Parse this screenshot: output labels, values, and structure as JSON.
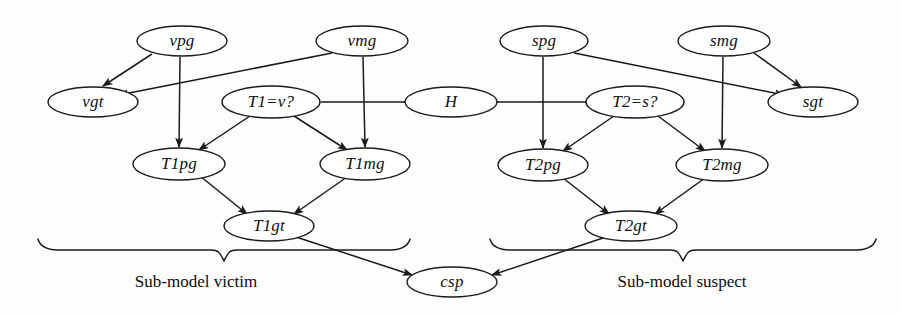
{
  "diagram": {
    "stroke_color": "#1a1a1a",
    "node_fill": "#ffffff",
    "background": "#fdfdfc",
    "nodes": [
      {
        "id": "vpg",
        "label": "vpg",
        "cx": 182,
        "cy": 41,
        "rx": 45,
        "ry": 15
      },
      {
        "id": "vmg",
        "label": "vmg",
        "cx": 362,
        "cy": 41,
        "rx": 46,
        "ry": 15
      },
      {
        "id": "vgt",
        "label": "vgt",
        "cx": 93,
        "cy": 102,
        "rx": 45,
        "ry": 15
      },
      {
        "id": "T1v",
        "label": "T1=v?",
        "cx": 271,
        "cy": 102,
        "rx": 49,
        "ry": 16
      },
      {
        "id": "H",
        "label": "H",
        "cx": 451,
        "cy": 102,
        "rx": 46,
        "ry": 15
      },
      {
        "id": "T2s",
        "label": "T2=s?",
        "cx": 635,
        "cy": 102,
        "rx": 49,
        "ry": 16
      },
      {
        "id": "spg",
        "label": "spg",
        "cx": 544,
        "cy": 41,
        "rx": 44,
        "ry": 15
      },
      {
        "id": "smg",
        "label": "smg",
        "cx": 724,
        "cy": 41,
        "rx": 46,
        "ry": 15
      },
      {
        "id": "sgt",
        "label": "sgt",
        "cx": 813,
        "cy": 102,
        "rx": 45,
        "ry": 15
      },
      {
        "id": "T1pg",
        "label": "T1pg",
        "cx": 179,
        "cy": 164,
        "rx": 46,
        "ry": 16
      },
      {
        "id": "T1mg",
        "label": "T1mg",
        "cx": 365,
        "cy": 164,
        "rx": 45,
        "ry": 16
      },
      {
        "id": "T1gt",
        "label": "T1gt",
        "cx": 269,
        "cy": 226,
        "rx": 45,
        "ry": 15
      },
      {
        "id": "T2pg",
        "label": "T2pg",
        "cx": 543,
        "cy": 165,
        "rx": 45,
        "ry": 16
      },
      {
        "id": "T2mg",
        "label": "T2mg",
        "cx": 722,
        "cy": 165,
        "rx": 46,
        "ry": 16
      },
      {
        "id": "T2gt",
        "label": "T2gt",
        "cx": 631,
        "cy": 226,
        "rx": 46,
        "ry": 15
      },
      {
        "id": "csp",
        "label": "csp",
        "cx": 452,
        "cy": 282,
        "rx": 45,
        "ry": 15
      }
    ],
    "edges": [
      {
        "id": "vpg-vgt",
        "from": "vpg",
        "to": "vgt",
        "path": "M 152 54 L 103 86"
      },
      {
        "id": "vmg-vgt",
        "from": "vmg",
        "to": "vgt",
        "path": "M 332 53 L 119 95"
      },
      {
        "id": "vpg-T1pg",
        "from": "vpg",
        "to": "T1pg",
        "path": "M 180 57 L 179 147"
      },
      {
        "id": "vmg-T1mg",
        "from": "vmg",
        "to": "T1mg",
        "path": "M 363 57 L 365 147"
      },
      {
        "id": "T1v-H",
        "from": "T1v",
        "to": "H",
        "path": "M 321 102 L 498 102"
      },
      {
        "id": "T1v-T1pg",
        "from": "T1v",
        "to": "T1pg",
        "path": "M 250 116 L 199 150"
      },
      {
        "id": "T1v-T1mg",
        "from": "T1v",
        "to": "T1mg",
        "path": "M 294 116 L 347 150"
      },
      {
        "id": "T1pg-T1gt",
        "from": "T1pg",
        "to": "T1gt",
        "path": "M 200 176 L 247 214"
      },
      {
        "id": "T1mg-T1gt",
        "from": "T1mg",
        "to": "T1gt",
        "path": "M 347 177 L 294 214"
      },
      {
        "id": "T1gt-csp",
        "from": "T1gt",
        "to": "csp",
        "path": "M 296 237 L 412 275"
      },
      {
        "id": "smg-sgt",
        "from": "smg",
        "to": "sgt",
        "path": "M 754 53 L 801 87"
      },
      {
        "id": "spg-sgt",
        "from": "spg",
        "to": "sgt",
        "path": "M 574 53 L 784 95"
      },
      {
        "id": "spg-T2pg",
        "from": "spg",
        "to": "T2pg",
        "path": "M 543 57 L 543 148"
      },
      {
        "id": "smg-T2mg",
        "from": "smg",
        "to": "T2mg",
        "path": "M 723 57 L 722 148"
      },
      {
        "id": "T2s-H",
        "from": "T2s",
        "to": "H",
        "path": "M 586 102 L 404 102"
      },
      {
        "id": "T2s-T2pg",
        "from": "T2s",
        "to": "T2pg",
        "path": "M 614 116 L 563 151"
      },
      {
        "id": "T2s-T2mg",
        "from": "T2s",
        "to": "T2mg",
        "path": "M 658 116 L 705 151"
      },
      {
        "id": "T2pg-T2gt",
        "from": "T2pg",
        "to": "T2gt",
        "path": "M 563 178 L 609 214"
      },
      {
        "id": "T2mg-T2gt",
        "from": "T2mg",
        "to": "T2gt",
        "path": "M 705 178 L 655 214"
      },
      {
        "id": "T2gt-csp",
        "from": "T2gt",
        "to": "csp",
        "path": "M 606 237 L 492 275"
      }
    ],
    "braces": [
      {
        "id": "brace-victim",
        "label": "Sub-model victim",
        "x_start": 38,
        "x_end": 410,
        "y": 250,
        "label_cx": 196,
        "label_cy": 282
      },
      {
        "id": "brace-suspect",
        "label": "Sub-model suspect",
        "x_start": 490,
        "x_end": 876,
        "y": 250,
        "label_cx": 682,
        "label_cy": 282
      }
    ]
  }
}
